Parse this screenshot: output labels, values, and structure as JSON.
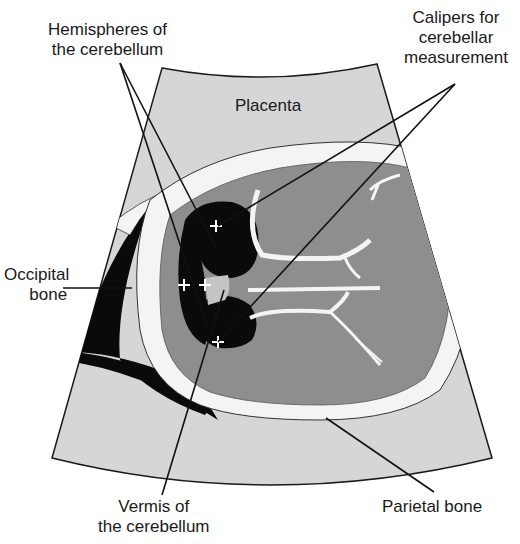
{
  "diagram": {
    "colors": {
      "background": "#ffffff",
      "placenta_fan": "#d6d6d6",
      "brain": "#8e8e8e",
      "fluid_black": "#0a0a0a",
      "bone_white": "#f4f4f4",
      "vermis": "#c4c4c4",
      "leader_line": "#111111"
    },
    "labels": {
      "hemispheres": {
        "line1": "Hemispheres of",
        "line2": "the cerebellum"
      },
      "calipers": {
        "line1": "Calipers for",
        "line2": "cerebellar",
        "line3": "measurement"
      },
      "placenta": {
        "text": "Placenta"
      },
      "occipital": {
        "line1": "Occipital",
        "line2": "bone"
      },
      "vermis": {
        "line1": "Vermis of",
        "line2": "the cerebellum"
      },
      "parietal": {
        "text": "Parietal bone"
      }
    },
    "calipers_markers": [
      {
        "symbol": "+",
        "x": 216,
        "y": 226
      },
      {
        "symbol": "+",
        "x": 218,
        "y": 342
      },
      {
        "symbol": "+",
        "x": 184,
        "y": 285
      },
      {
        "symbol": "+",
        "x": 205,
        "y": 285
      }
    ]
  }
}
